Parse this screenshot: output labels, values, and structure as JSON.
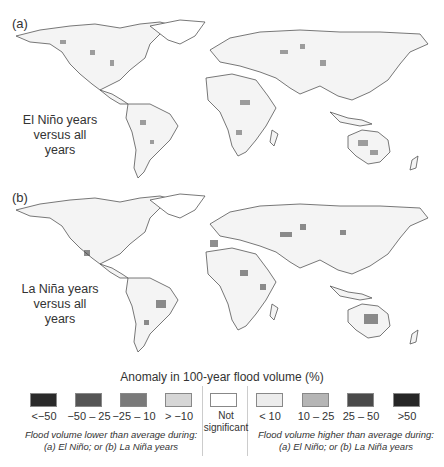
{
  "panels": [
    {
      "label": "(a)",
      "caption_line1": "El Niño years",
      "caption_line2": "versus all years"
    },
    {
      "label": "(b)",
      "caption_line1": "La Niña years",
      "caption_line2": "versus all years"
    }
  ],
  "legend": {
    "title": "Anomaly in 100-year flood volume (%)",
    "lower": {
      "items": [
        {
          "label": "<−50",
          "color": "#2a2a2a"
        },
        {
          "label": "−50 – 25",
          "color": "#555555"
        },
        {
          "label": "−25 – 10",
          "color": "#7a7a7a"
        },
        {
          "label": "> −10",
          "color": "#d6d6d6"
        }
      ],
      "note_line1": "Flood volume lower than average during:",
      "note_line2": "(a) El Niño; or (b) La Niña years"
    },
    "neutral": {
      "label_line1": "Not",
      "label_line2": "significant",
      "color": "#ffffff"
    },
    "higher": {
      "items": [
        {
          "label": "< 10",
          "color": "#ececec"
        },
        {
          "label": "10 – 25",
          "color": "#b5b5b5"
        },
        {
          "label": "25 – 50",
          "color": "#4a4a4a"
        },
        {
          "label": ">50",
          "color": "#262626"
        }
      ],
      "note_line1": "Flood volume higher than average during:",
      "note_line2": "(a) El Niño; or (b) La Niña years"
    }
  }
}
